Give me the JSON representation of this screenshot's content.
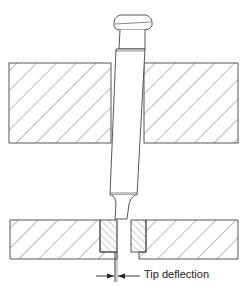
{
  "diagram": {
    "labels": {
      "tip_deflection": "Tip deflection"
    },
    "components": {
      "punch": "punch-tool",
      "upper_plate": "stripper-plate",
      "lower_plate": "die-plate",
      "bushings": "die-bushing"
    },
    "colors": {
      "stroke": "#444444",
      "hatch": "#666666",
      "background": "#ffffff"
    }
  }
}
